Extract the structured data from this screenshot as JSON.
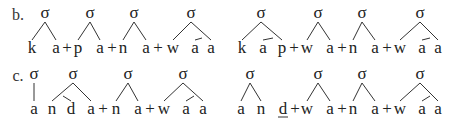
{
  "rows": [
    {
      "label": "b.",
      "label_x": 18,
      "sigma_y": 18,
      "base_y": 53,
      "sigma": "σ",
      "left": {
        "segments": [
          {
            "t": "k",
            "x": 32
          },
          {
            "t": "a",
            "x": 56
          },
          {
            "t": "+",
            "x": 67
          },
          {
            "t": "p",
            "x": 78
          },
          {
            "t": "a",
            "x": 100
          },
          {
            "t": "+",
            "x": 112
          },
          {
            "t": "n",
            "x": 123
          },
          {
            "t": "a",
            "x": 146
          },
          {
            "t": "+",
            "x": 158
          },
          {
            "t": "w",
            "x": 173
          },
          {
            "t": "a",
            "x": 195
          },
          {
            "t": "a",
            "x": 211
          }
        ],
        "sigmas": [
          {
            "x": 45,
            "branches": [
              [
                45,
                32
              ],
              [
                45,
                56
              ]
            ]
          },
          {
            "x": 90,
            "branches": [
              [
                90,
                78
              ],
              [
                90,
                100
              ]
            ]
          },
          {
            "x": 134,
            "branches": [
              [
                134,
                123
              ],
              [
                134,
                146
              ]
            ]
          },
          {
            "x": 191,
            "branches": [
              [
                191,
                173
              ],
              [
                191,
                211
              ]
            ],
            "sub": {
              "from": [
                202,
                35
              ],
              "to": [
                195,
                211
              ]
            }
          }
        ]
      },
      "right": {
        "segments": [
          {
            "t": "k",
            "x": 242
          },
          {
            "t": "a",
            "x": 263
          },
          {
            "t": "p",
            "x": 282
          },
          {
            "t": "+",
            "x": 294
          },
          {
            "t": "w",
            "x": 307
          },
          {
            "t": "a",
            "x": 330
          },
          {
            "t": "+",
            "x": 342
          },
          {
            "t": "n",
            "x": 353
          },
          {
            "t": "a",
            "x": 375
          },
          {
            "t": "+",
            "x": 387
          },
          {
            "t": "w",
            "x": 400
          },
          {
            "t": "a",
            "x": 422
          },
          {
            "t": "a",
            "x": 438
          }
        ],
        "sigmas": [
          {
            "x": 261,
            "branches": [
              [
                261,
                242
              ],
              [
                261,
                282
              ]
            ],
            "sub": {
              "from": [
                273,
                35
              ],
              "to": [
                263,
                282
              ]
            }
          },
          {
            "x": 318,
            "branches": [
              [
                318,
                307
              ],
              [
                318,
                330
              ]
            ]
          },
          {
            "x": 362,
            "branches": [
              [
                362,
                353
              ],
              [
                362,
                375
              ]
            ]
          },
          {
            "x": 420,
            "branches": [
              [
                420,
                400
              ],
              [
                420,
                438
              ]
            ],
            "sub": {
              "from": [
                430,
                35
              ],
              "to": [
                422,
                438
              ]
            }
          }
        ]
      }
    },
    {
      "label": "c.",
      "label_x": 18,
      "sigma_y": 79,
      "base_y": 114,
      "sigma": "σ",
      "left": {
        "segments": [
          {
            "t": "a",
            "x": 34
          },
          {
            "t": "n",
            "x": 52
          },
          {
            "t": "d",
            "x": 71
          },
          {
            "t": "a",
            "x": 91
          },
          {
            "t": "+",
            "x": 103
          },
          {
            "t": "n",
            "x": 116
          },
          {
            "t": "a",
            "x": 138
          },
          {
            "t": "+",
            "x": 150
          },
          {
            "t": "w",
            "x": 164
          },
          {
            "t": "a",
            "x": 186
          },
          {
            "t": "a",
            "x": 203
          }
        ],
        "sigmas": [
          {
            "x": 34,
            "branches": [
              [
                34,
                34
              ]
            ]
          },
          {
            "x": 73,
            "branches": [
              [
                73,
                52
              ],
              [
                73,
                91
              ]
            ],
            "sub": {
              "from": [
                63,
                96
              ],
              "to": [
                52,
                71
              ],
              "left": true
            }
          },
          {
            "x": 128,
            "branches": [
              [
                128,
                116
              ],
              [
                128,
                138
              ]
            ]
          },
          {
            "x": 183,
            "branches": [
              [
                183,
                164
              ],
              [
                183,
                203
              ]
            ],
            "sub": {
              "from": [
                194,
                96
              ],
              "to": [
                186,
                203
              ]
            }
          }
        ]
      },
      "right": {
        "segments": [
          {
            "t": "a",
            "x": 241
          },
          {
            "t": "n",
            "x": 261
          },
          {
            "t": "d",
            "x": 283,
            "underline": true
          },
          {
            "t": "+",
            "x": 295
          },
          {
            "t": "w",
            "x": 307
          },
          {
            "t": "a",
            "x": 330
          },
          {
            "t": "+",
            "x": 342
          },
          {
            "t": "n",
            "x": 353
          },
          {
            "t": "a",
            "x": 375
          },
          {
            "t": "+",
            "x": 387
          },
          {
            "t": "w",
            "x": 400
          },
          {
            "t": "a",
            "x": 422
          },
          {
            "t": "a",
            "x": 438
          }
        ],
        "sigmas": [
          {
            "x": 250,
            "branches": [
              [
                250,
                241
              ],
              [
                250,
                261
              ]
            ]
          },
          {
            "x": 318,
            "branches": [
              [
                318,
                307
              ],
              [
                318,
                330
              ]
            ]
          },
          {
            "x": 362,
            "branches": [
              [
                362,
                353
              ],
              [
                362,
                375
              ]
            ]
          },
          {
            "x": 420,
            "branches": [
              [
                420,
                400
              ],
              [
                420,
                438
              ]
            ],
            "sub": {
              "from": [
                430,
                96
              ],
              "to": [
                422,
                438
              ]
            }
          }
        ]
      }
    }
  ]
}
